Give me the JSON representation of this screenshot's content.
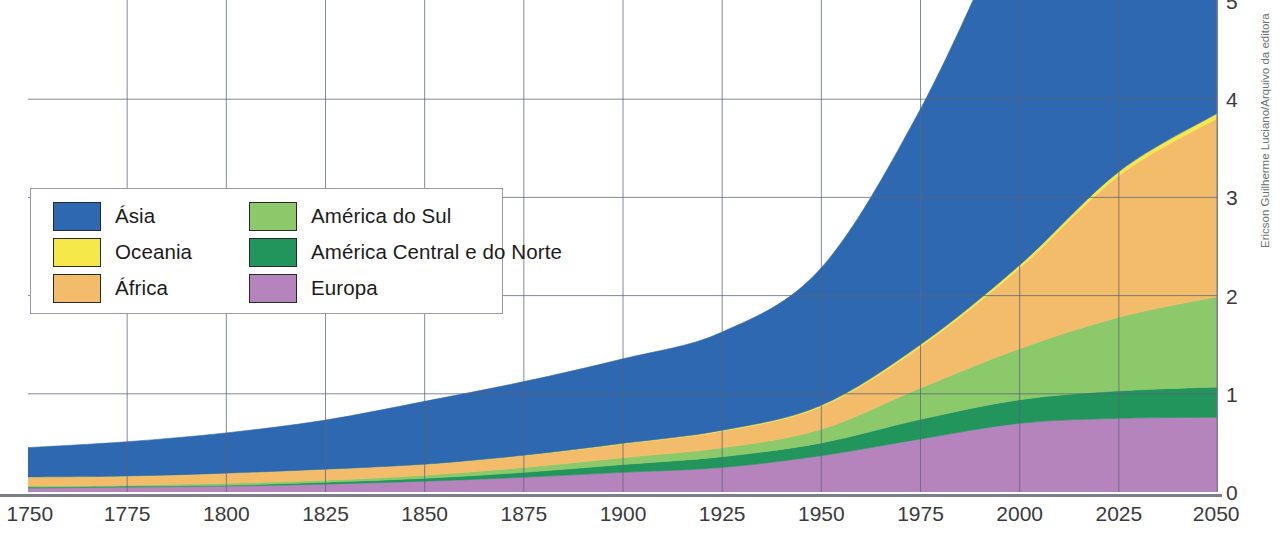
{
  "credit": "Ericson Guilherme Luciano/Arquivo da editora",
  "legend": {
    "items": [
      {
        "label": "Ásia",
        "color": "#2e68b0"
      },
      {
        "label": "América do Sul",
        "color": "#8cc96b"
      },
      {
        "label": "Oceania",
        "color": "#f5e84b"
      },
      {
        "label": "América Central e do Norte",
        "color": "#22955c"
      },
      {
        "label": "África",
        "color": "#f2bc6b"
      },
      {
        "label": "Europa",
        "color": "#b584bc"
      }
    ]
  },
  "axes": {
    "y_ticks": [
      "5",
      "4",
      "3",
      "2",
      "1",
      "0"
    ],
    "x_ticks": [
      "1750",
      "1775",
      "1800",
      "1825",
      "1850",
      "1875",
      "1900",
      "1925",
      "1950",
      "1975",
      "2000",
      "2025",
      "2050"
    ],
    "grid_color": "#5a6378",
    "axis_color": "#7c7c8a"
  },
  "chart_data": {
    "type": "area",
    "title": "",
    "xlabel": "",
    "ylabel": "",
    "stacked": true,
    "grid": true,
    "legend_position": "inside-left",
    "xlim": [
      1750,
      2050
    ],
    "ylim": [
      0,
      5
    ],
    "y_unit": "bilhões de habitantes",
    "x": [
      1750,
      1775,
      1800,
      1825,
      1850,
      1875,
      1900,
      1925,
      1950,
      1975,
      2000,
      2025,
      2050
    ],
    "series": [
      {
        "name": "Europa",
        "color": "#b584bc",
        "values": [
          0.04,
          0.05,
          0.06,
          0.08,
          0.11,
          0.15,
          0.2,
          0.25,
          0.37,
          0.54,
          0.7,
          0.75,
          0.76
        ]
      },
      {
        "name": "América Central e do Norte",
        "color": "#22955c",
        "values": [
          0.01,
          0.01,
          0.01,
          0.02,
          0.03,
          0.05,
          0.08,
          0.11,
          0.13,
          0.2,
          0.24,
          0.28,
          0.31
        ]
      },
      {
        "name": "América do Sul",
        "color": "#8cc96b",
        "values": [
          0.01,
          0.01,
          0.02,
          0.02,
          0.03,
          0.05,
          0.07,
          0.09,
          0.14,
          0.32,
          0.52,
          0.75,
          0.92
        ]
      },
      {
        "name": "África",
        "color": "#f2bc6b",
        "values": [
          0.09,
          0.09,
          0.1,
          0.11,
          0.11,
          0.12,
          0.14,
          0.17,
          0.23,
          0.42,
          0.82,
          1.44,
          1.82
        ]
      },
      {
        "name": "Oceania",
        "color": "#f5e84b",
        "values": [
          0.002,
          0.002,
          0.002,
          0.002,
          0.003,
          0.004,
          0.006,
          0.009,
          0.013,
          0.021,
          0.031,
          0.042,
          0.051
        ]
      },
      {
        "name": "Ásia",
        "color": "#2e68b0",
        "values": [
          0.3,
          0.35,
          0.41,
          0.5,
          0.64,
          0.75,
          0.86,
          1.0,
          1.4,
          2.4,
          3.7,
          4.6,
          5.2
        ]
      }
    ]
  }
}
